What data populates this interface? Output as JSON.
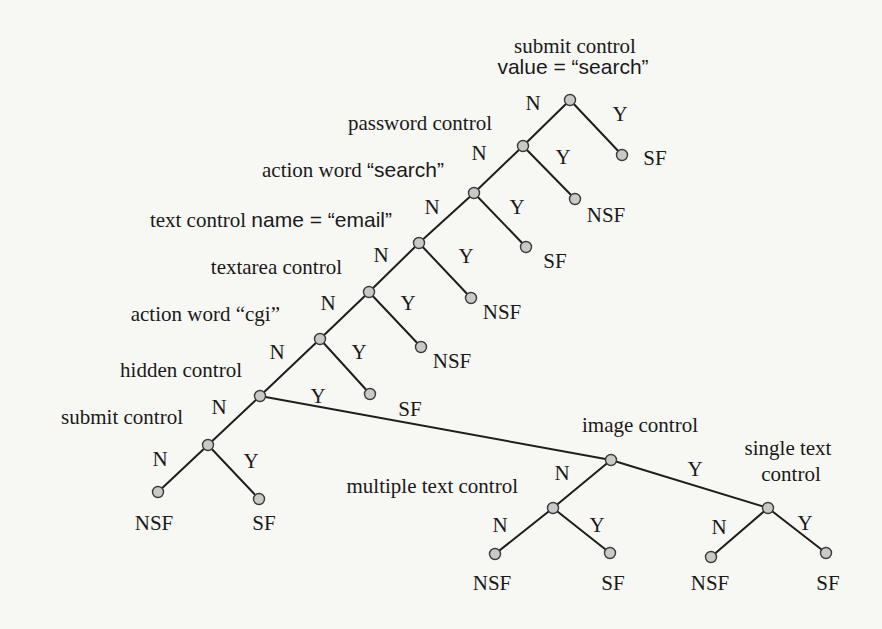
{
  "diagram": {
    "type": "decision-tree",
    "colors": {
      "edge": "#1e1e1e",
      "node_fill": "#c9c9c9",
      "node_stroke": "#3a3a3a",
      "background": "#f7f7f4"
    },
    "nodes": [
      {
        "id": "root",
        "x": 570,
        "y": 100,
        "label_lines": [
          {
            "parts": [
              {
                "t": "submit control",
                "f": "serif"
              }
            ],
            "x": 575,
            "y": 53,
            "anchor": "middle"
          },
          {
            "parts": [
              {
                "t": "value = “search”",
                "f": "sans"
              }
            ],
            "x": 573,
            "y": 74,
            "anchor": "middle"
          }
        ]
      },
      {
        "id": "password",
        "x": 523,
        "y": 146,
        "label_lines": [
          {
            "parts": [
              {
                "t": "password control",
                "f": "serif"
              }
            ],
            "x": 492,
            "y": 130,
            "anchor": "end"
          }
        ]
      },
      {
        "id": "action-search",
        "x": 474,
        "y": 193,
        "label_lines": [
          {
            "parts": [
              {
                "t": "action word ",
                "f": "serif"
              },
              {
                "t": "“search”",
                "f": "sans"
              }
            ],
            "x": 444,
            "y": 177,
            "anchor": "end"
          }
        ]
      },
      {
        "id": "email",
        "x": 419,
        "y": 243,
        "label_lines": [
          {
            "parts": [
              {
                "t": "text control ",
                "f": "serif"
              },
              {
                "t": "name = “email”",
                "f": "sans"
              }
            ],
            "x": 392,
            "y": 227,
            "anchor": "end"
          }
        ]
      },
      {
        "id": "textarea",
        "x": 369,
        "y": 292,
        "label_lines": [
          {
            "parts": [
              {
                "t": "textarea control",
                "f": "serif"
              }
            ],
            "x": 342,
            "y": 274,
            "anchor": "end"
          }
        ]
      },
      {
        "id": "cgi",
        "x": 320,
        "y": 339,
        "label_lines": [
          {
            "parts": [
              {
                "t": "action word “cgi”",
                "f": "serif"
              }
            ],
            "x": 280,
            "y": 321,
            "anchor": "end"
          }
        ]
      },
      {
        "id": "hidden",
        "x": 260,
        "y": 396,
        "label_lines": [
          {
            "parts": [
              {
                "t": "hidden control",
                "f": "serif"
              }
            ],
            "x": 242,
            "y": 377,
            "anchor": "end"
          }
        ]
      },
      {
        "id": "submit",
        "x": 208,
        "y": 445,
        "label_lines": [
          {
            "parts": [
              {
                "t": "submit control",
                "f": "serif"
              }
            ],
            "x": 183,
            "y": 424,
            "anchor": "end"
          }
        ]
      },
      {
        "id": "image",
        "x": 611,
        "y": 460,
        "label_lines": [
          {
            "parts": [
              {
                "t": "image control",
                "f": "serif"
              }
            ],
            "x": 640,
            "y": 432,
            "anchor": "middle"
          }
        ]
      },
      {
        "id": "multiple-text",
        "x": 553,
        "y": 508,
        "label_lines": [
          {
            "parts": [
              {
                "t": "multiple text control",
                "f": "serif"
              }
            ],
            "x": 518,
            "y": 493,
            "anchor": "end"
          }
        ]
      },
      {
        "id": "single-text",
        "x": 768,
        "y": 508,
        "label_lines": [
          {
            "parts": [
              {
                "t": "single text",
                "f": "serif"
              }
            ],
            "x": 788,
            "y": 455,
            "anchor": "middle"
          },
          {
            "parts": [
              {
                "t": "control",
                "f": "serif"
              }
            ],
            "x": 791,
            "y": 481,
            "anchor": "middle"
          }
        ]
      }
    ],
    "leaves": [
      {
        "x": 622,
        "y": 155,
        "label": "SF",
        "lx": 655,
        "ly": 165,
        "anchor": "middle"
      },
      {
        "x": 575,
        "y": 199,
        "label": "NSF",
        "lx": 606,
        "ly": 222,
        "anchor": "middle"
      },
      {
        "x": 526,
        "y": 247,
        "label": "SF",
        "lx": 555,
        "ly": 268,
        "anchor": "middle"
      },
      {
        "x": 471,
        "y": 298,
        "label": "NSF",
        "lx": 502,
        "ly": 319,
        "anchor": "middle"
      },
      {
        "x": 421,
        "y": 347,
        "label": "NSF",
        "lx": 452,
        "ly": 368,
        "anchor": "middle"
      },
      {
        "x": 370,
        "y": 394,
        "label": "SF",
        "lx": 410,
        "ly": 416,
        "anchor": "middle"
      },
      {
        "x": 158,
        "y": 492,
        "label": "NSF",
        "lx": 154,
        "ly": 530,
        "anchor": "middle"
      },
      {
        "x": 259,
        "y": 499,
        "label": "SF",
        "lx": 264,
        "ly": 530,
        "anchor": "middle"
      },
      {
        "x": 495,
        "y": 554,
        "label": "NSF",
        "lx": 492,
        "ly": 590,
        "anchor": "middle"
      },
      {
        "x": 610,
        "y": 553,
        "label": "SF",
        "lx": 613,
        "ly": 590,
        "anchor": "middle"
      },
      {
        "x": 711,
        "y": 557,
        "label": "NSF",
        "lx": 710,
        "ly": 590,
        "anchor": "middle"
      },
      {
        "x": 826,
        "y": 553,
        "label": "SF",
        "lx": 828,
        "ly": 590,
        "anchor": "middle"
      }
    ],
    "edges": [
      {
        "x1": 570,
        "y1": 100,
        "x2": 523,
        "y2": 146,
        "label": "N",
        "lx": 533,
        "ly": 110
      },
      {
        "x1": 570,
        "y1": 100,
        "x2": 622,
        "y2": 155,
        "label": "Y",
        "lx": 620,
        "ly": 121
      },
      {
        "x1": 523,
        "y1": 146,
        "x2": 474,
        "y2": 193,
        "label": "N",
        "lx": 479,
        "ly": 160
      },
      {
        "x1": 523,
        "y1": 146,
        "x2": 575,
        "y2": 199,
        "label": "Y",
        "lx": 563,
        "ly": 164
      },
      {
        "x1": 474,
        "y1": 193,
        "x2": 419,
        "y2": 243,
        "label": "N",
        "lx": 432,
        "ly": 214
      },
      {
        "x1": 474,
        "y1": 193,
        "x2": 526,
        "y2": 247,
        "label": "Y",
        "lx": 517,
        "ly": 214
      },
      {
        "x1": 419,
        "y1": 243,
        "x2": 369,
        "y2": 292,
        "label": "N",
        "lx": 381,
        "ly": 262
      },
      {
        "x1": 419,
        "y1": 243,
        "x2": 471,
        "y2": 298,
        "label": "Y",
        "lx": 466,
        "ly": 263
      },
      {
        "x1": 369,
        "y1": 292,
        "x2": 320,
        "y2": 339,
        "label": "N",
        "lx": 328,
        "ly": 310
      },
      {
        "x1": 369,
        "y1": 292,
        "x2": 421,
        "y2": 347,
        "label": "Y",
        "lx": 408,
        "ly": 310
      },
      {
        "x1": 320,
        "y1": 339,
        "x2": 260,
        "y2": 396,
        "label": "N",
        "lx": 277,
        "ly": 359
      },
      {
        "x1": 320,
        "y1": 339,
        "x2": 370,
        "y2": 394,
        "label": "Y",
        "lx": 359,
        "ly": 359
      },
      {
        "x1": 260,
        "y1": 396,
        "x2": 208,
        "y2": 445,
        "label": "N",
        "lx": 219,
        "ly": 414
      },
      {
        "x1": 260,
        "y1": 396,
        "x2": 611,
        "y2": 460,
        "label": "Y",
        "lx": 318,
        "ly": 403
      },
      {
        "x1": 208,
        "y1": 445,
        "x2": 158,
        "y2": 492,
        "label": "N",
        "lx": 160,
        "ly": 466
      },
      {
        "x1": 208,
        "y1": 445,
        "x2": 259,
        "y2": 499,
        "label": "Y",
        "lx": 251,
        "ly": 468
      },
      {
        "x1": 611,
        "y1": 460,
        "x2": 553,
        "y2": 508,
        "label": "N",
        "lx": 562,
        "ly": 480
      },
      {
        "x1": 611,
        "y1": 460,
        "x2": 768,
        "y2": 508,
        "label": "Y",
        "lx": 695,
        "ly": 476
      },
      {
        "x1": 553,
        "y1": 508,
        "x2": 495,
        "y2": 554,
        "label": "N",
        "lx": 500,
        "ly": 532
      },
      {
        "x1": 553,
        "y1": 508,
        "x2": 610,
        "y2": 553,
        "label": "Y",
        "lx": 597,
        "ly": 532
      },
      {
        "x1": 768,
        "y1": 508,
        "x2": 711,
        "y2": 557,
        "label": "N",
        "lx": 719,
        "ly": 534
      },
      {
        "x1": 768,
        "y1": 508,
        "x2": 826,
        "y2": 553,
        "label": "Y",
        "lx": 805,
        "ly": 530
      }
    ]
  }
}
